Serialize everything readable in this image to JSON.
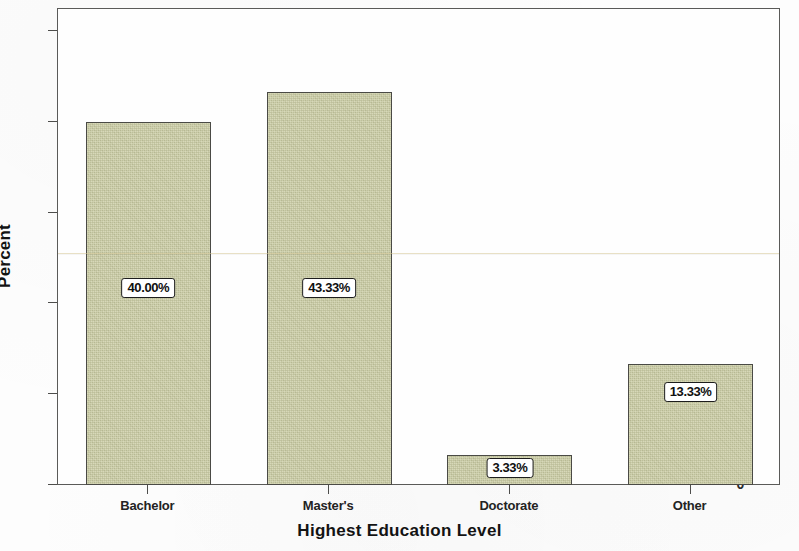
{
  "chart_data": {
    "type": "bar",
    "title": "",
    "xlabel": "Highest Education Level",
    "ylabel": "Percent",
    "categories": [
      "Bachelor",
      "Master's",
      "Doctorate",
      "Other"
    ],
    "values": [
      40.0,
      43.33,
      3.33,
      13.33
    ],
    "value_labels": [
      "40.00%",
      "43.33%",
      "3.33%",
      "13.33%"
    ],
    "ylim": [
      0,
      52.5
    ],
    "ytick_labels": [
      "0",
      "10",
      "20",
      "30",
      "40",
      "50"
    ],
    "ytick_values": [
      0,
      10,
      20,
      30,
      40,
      50
    ],
    "grid": false,
    "legend": "none",
    "bar_fill_color": "#cbcda4",
    "bar_border_color": "#4a4a45",
    "axis_color": "#5a5a58",
    "text_color": "#131313",
    "label_box_fill": "#ffffff",
    "label_box_border": "#1d1d1d",
    "background_color": "#fdfdfd"
  }
}
